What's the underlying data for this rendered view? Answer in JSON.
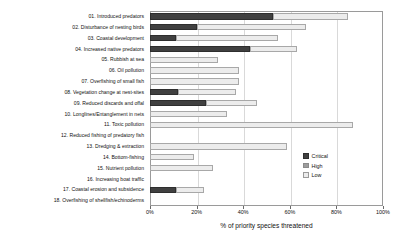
{
  "chart_data": {
    "type": "bar",
    "orientation": "horizontal",
    "stacked": true,
    "title": "",
    "subtitle": "",
    "xlabel": "% of priority species threatened",
    "ylabel": "",
    "xlim": [
      0,
      100
    ],
    "xticks": [
      0,
      20,
      40,
      60,
      80,
      100
    ],
    "xtick_labels": [
      "0%",
      "20%",
      "40%",
      "60%",
      "80%",
      "100%"
    ],
    "grid": true,
    "grid_axis": "x",
    "legend_position": "center-right",
    "categories": [
      "01. Introduced predators",
      "02. Disturbance of nesting birds",
      "03. Coastal development",
      "04. Increased native predators",
      "05. Rubbish at sea",
      "06. Oil pollution",
      "07. Overfishing of small fish",
      "08. Vegetation change at nest-sites",
      "09. Reduced discards and offal",
      "10. Longlines/Entanglement in nets",
      "11. Toxic pollution",
      "12. Reduced fishing of predatory fish",
      "13. Dredging & extraction",
      "14. Bottom-fishing",
      "15. Nutrient pollution",
      "16. Increasing boat traffic",
      "17. Coastal erosion and subsidence",
      "18. Overfishing of shellfish/echinoderms"
    ],
    "series": [
      {
        "name": "Critical",
        "color": "#404040",
        "values": [
          53,
          20,
          11,
          43,
          0,
          0,
          0,
          12,
          24,
          0,
          0,
          0,
          0,
          0,
          0,
          0,
          11,
          0
        ]
      },
      {
        "name": "High",
        "color": "#9d9d9d",
        "values": [
          0,
          0,
          0,
          0,
          0,
          0,
          0,
          0,
          0,
          0,
          0,
          0,
          0,
          0,
          0,
          0,
          0,
          0
        ]
      },
      {
        "name": "Low",
        "color": "#ececec",
        "values": [
          32,
          47,
          44,
          20,
          29,
          0,
          0,
          25,
          22,
          0,
          87,
          0,
          0,
          0,
          0,
          0,
          12,
          0
        ]
      }
    ],
    "totals": [
      85,
      67,
      55,
      63,
      29,
      38,
      38,
      37,
      46,
      33,
      87,
      0,
      59,
      19,
      27,
      0,
      23,
      0
    ]
  },
  "legend": {
    "items": [
      {
        "label": "Critical",
        "swatch": "critical"
      },
      {
        "label": "High",
        "swatch": "high"
      },
      {
        "label": "Low",
        "swatch": "low"
      }
    ]
  }
}
